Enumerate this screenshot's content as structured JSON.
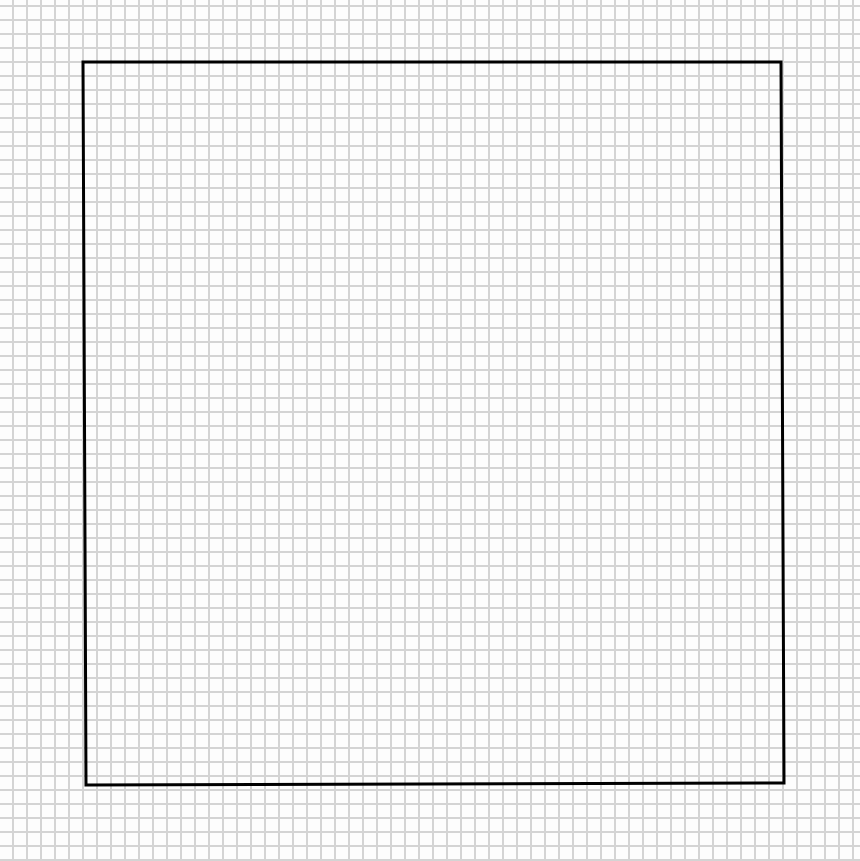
{
  "canvas": {
    "width": 860,
    "height": 861,
    "background": "#fdfdfd"
  },
  "grid": {
    "spacing_px": 14,
    "line_color": "#d4d4d4",
    "line_width": 2
  },
  "shape": {
    "type": "square",
    "stroke": "#000000",
    "stroke_width": 3,
    "points": "83,62 781,62 784,783 86,785"
  }
}
